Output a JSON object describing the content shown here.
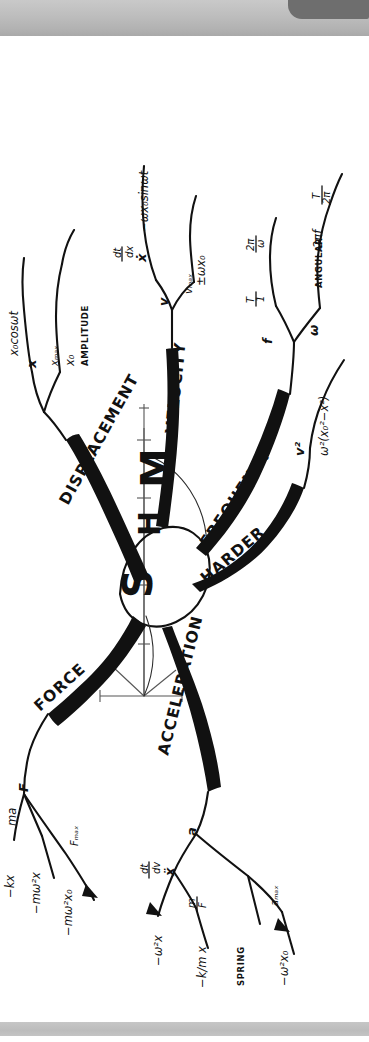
{
  "document": {
    "kind": "hand-drawn-mind-map",
    "subject": "Simple Harmonic Motion",
    "orientation_note": "page content drawn sideways (rotated 90 degrees)",
    "ink_color": "#111111",
    "paper_color": "#ffffff",
    "scanner_bar_color": "#bdbdbd",
    "scanner_tab_color": "#6e6e6e"
  },
  "center": {
    "letters": [
      "S",
      "H",
      "M"
    ],
    "s": "S",
    "h": "H",
    "m": "M"
  },
  "branches": {
    "displacement": {
      "label": "DISPLACEMENT",
      "symbol": "x",
      "children": [
        {
          "text": "x₀cosωt"
        },
        {
          "text": "xₘₐₓ",
          "arrow_to": "x₀",
          "note": "AMPLITUDE"
        }
      ],
      "child1": "x₀cosωt",
      "child2_a": "xₘₐₓ",
      "child2_b": "x₀",
      "child2_note": "AMPLITUDE"
    },
    "velocity": {
      "label": "VELOCITY",
      "symbol": "v",
      "child1_sym": "ẋ",
      "child1_over": "dx/dt",
      "child1_result": "−ωx₀sinωt",
      "child2_sym": "vₘₐₓ",
      "child2_result": "±ωx₀"
    },
    "frequency": {
      "label": "FREQUENCY",
      "f_symbol": "f",
      "f_child1": "1/T",
      "f_child2": "ω/2π",
      "omega_symbol": "ω",
      "omega_child1_note": "ANGULAR",
      "omega_child1": "2πf",
      "omega_child2": "2π/T"
    },
    "harder": {
      "label": "HARDER",
      "symbol": "v²",
      "result": "ω²(x₀²−x²)"
    },
    "force": {
      "label": "FORCE",
      "symbol": "F",
      "child1_sym": "ma",
      "child1_a": "−kx",
      "child1_b": "−mω²x",
      "child2_sym": "Fₘₐₓ",
      "child2_result": "−mω²x₀"
    },
    "acceleration": {
      "label": "ACCELERATION",
      "symbol": "a",
      "child1_sym": "ẍ",
      "child1_over": "dv/dt",
      "child1_result": "−ω²x",
      "child2_sym": "F/m",
      "child2_result": "−k/m x",
      "child2_note": "SPRING",
      "child3_sym": "aₘₐₓ",
      "child3_result": "−ω²x₀"
    }
  },
  "fractions": {
    "dx_dt_num": "dx",
    "dx_dt_den": "dt",
    "dv_dt_num": "dv",
    "dv_dt_den": "dt",
    "one_over_T_num": "1",
    "one_over_T_den": "T",
    "omega_over_2pi_num": "ω",
    "omega_over_2pi_den": "2π",
    "twopi_over_T_num": "2π",
    "twopi_over_T_den": "T",
    "F_over_m_num": "F",
    "F_over_m_den": "m",
    "k_over_m_num": "k",
    "k_over_m_den": "m"
  }
}
